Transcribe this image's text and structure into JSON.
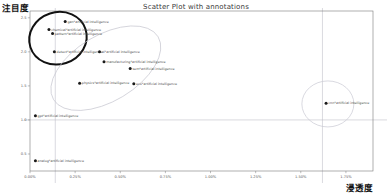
{
  "chart": {
    "title": "Scatter Plot with annotations",
    "y_axis_caption": "注目度",
    "x_axis_caption": "浸透度"
  },
  "chart_data": {
    "type": "scatter",
    "title": "Scatter Plot with annotations",
    "xlabel": "浸透度",
    "ylabel": "注目度",
    "xlim": [
      0.0,
      1.9
    ],
    "ylim": [
      0.25,
      2.6
    ],
    "grid": false,
    "legend": null,
    "x_ticks": [
      "0.00%",
      "0.25%",
      "0.50%",
      "0.75%",
      "1.00%",
      "1.25%",
      "1.50%",
      "1.75%"
    ],
    "x_tick_values": [
      0.0,
      0.25,
      0.5,
      0.75,
      1.0,
      1.25,
      1.5,
      1.75
    ],
    "y_ticks": [
      "2.5",
      "2.0",
      "1.5",
      "1.0",
      "0.5"
    ],
    "y_tick_values": [
      2.5,
      2.0,
      1.5,
      1.0,
      0.5
    ],
    "reference_lines": [
      {
        "orientation": "horizontal",
        "value": 1.0
      },
      {
        "orientation": "vertical",
        "value": 0.14
      },
      {
        "orientation": "vertical",
        "value": 1.62
      }
    ],
    "points": [
      {
        "label": "gan*artificial intelligence",
        "x": 0.195,
        "y": 2.445
      },
      {
        "label": "chemical*artificial intelligence",
        "x": 0.105,
        "y": 2.33
      },
      {
        "label": "pattern*artificial intelligence",
        "x": 0.125,
        "y": 2.27
      },
      {
        "label": "detect*artificial intelligence",
        "x": 0.135,
        "y": 2.0
      },
      {
        "label": "ai*artificial intelligence",
        "x": 0.385,
        "y": 2.0
      },
      {
        "label": "manufacturing*artificial intelligence",
        "x": 0.41,
        "y": 1.855
      },
      {
        "label": "sem*artificial intelligence",
        "x": 0.555,
        "y": 1.755
      },
      {
        "label": "physics*artificial intelligence",
        "x": 0.275,
        "y": 1.54
      },
      {
        "label": "eco*artificial intelligence",
        "x": 0.575,
        "y": 1.53
      },
      {
        "label": "gpt*artificial intelligence",
        "x": 0.03,
        "y": 1.06
      },
      {
        "label": "cnn*artificial intelligence",
        "x": 1.64,
        "y": 1.245
      },
      {
        "label": "analog*artificial intelligence",
        "x": 0.03,
        "y": 0.4
      }
    ],
    "annotation_ellipses": [
      {
        "name": "highlight-cluster",
        "cx": 0.155,
        "cy": 2.2,
        "emphasis": "bold"
      },
      {
        "name": "mid-cluster",
        "cx": 0.42,
        "cy": 1.76,
        "emphasis": "light"
      },
      {
        "name": "outlier-cluster",
        "cx": 1.65,
        "cy": 1.235,
        "emphasis": "light"
      }
    ]
  },
  "colors": {
    "dot": "#1a1a1a",
    "frame": "#7a7a7a",
    "reference_line": "#b9b9c4",
    "ellipse_bold": "#111111",
    "ellipse_light": "#c9c9d2",
    "text": "#4a4a4a",
    "caption": "#111111"
  }
}
